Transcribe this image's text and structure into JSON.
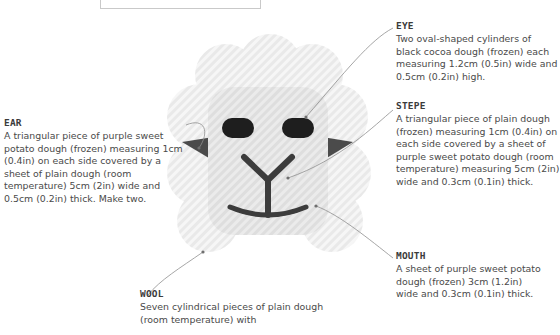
{
  "page": {
    "background_color": "#ffffff",
    "text_color": "#4a4a4a",
    "title_color": "#3b3b3b"
  },
  "top_box": {
    "label": "",
    "border_color": "#c9c9c9"
  },
  "illustration": {
    "name": "sheep-face-diagram",
    "wool_color": "#e6e6e6",
    "wool_stripe_color": "#f4f4f4",
    "face_color": "#dcdcdc",
    "eye_color": "#1c1c1c",
    "ear_color": "#4a4a4a",
    "mouth_color": "#3a3a3a",
    "nose_color": "#3a3a3a"
  },
  "annotations": [
    {
      "id": "ear",
      "title": "EAR",
      "body": "A triangular piece of purple sweet potato dough (frozen) measuring 1cm (0.4in) on each side covered by a sheet of plain dough (room temperature) 5cm (2in) wide and 0.5cm (0.2in) thick. Make two."
    },
    {
      "id": "eye",
      "title": "EYE",
      "body": "Two oval-shaped cylinders of black cocoa dough (frozen) each measuring 1.2cm (0.5in) wide and 0.5cm (0.2in) high."
    },
    {
      "id": "stepe",
      "title": "STEPE",
      "body": "A triangular piece of plain dough (frozen) measuring 1cm (0.4in) on each side covered by a sheet of purple sweet potato dough (room temperature) measuring 5cm (2in) wide and 0.3cm (0.1in) thick."
    },
    {
      "id": "mouth",
      "title": "MOUTH",
      "body": "A sheet of purple sweet potato dough (frozen) 3cm (1.2in) wide and 0.3cm (0.1in) thick."
    },
    {
      "id": "wool",
      "title": "WOOL",
      "body": "Seven cylindrical pieces of plain dough (room temperature) with"
    }
  ],
  "leader_line_color": "#8a8a8a"
}
